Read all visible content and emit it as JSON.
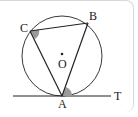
{
  "diagram": {
    "type": "circle-tangent-chord",
    "labels": {
      "A": "A",
      "B": "B",
      "C": "C",
      "O": "O",
      "T": "T"
    },
    "elements": [
      "circle centered at O",
      "triangle ABC inscribed",
      "tangent line AT at A"
    ],
    "marked_angles": [
      "angle ACB",
      "angle BAT"
    ],
    "colors": {
      "line": "#222222",
      "angle_fill": "#9a9a9a",
      "frame": "#d0d0d0"
    }
  }
}
